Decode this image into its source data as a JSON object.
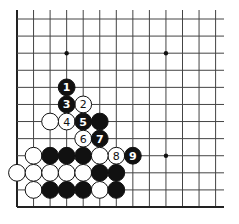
{
  "diagram": {
    "type": "go-board-corner",
    "corner": "bottom-left",
    "columns_visible": 13,
    "rows_visible": 12,
    "star_points": [
      {
        "col": 3,
        "row": 2
      },
      {
        "col": 9,
        "row": 2
      },
      {
        "col": 9,
        "row": 8
      }
    ],
    "colors": {
      "black_stone": "#111111",
      "white_stone": "#ffffff",
      "line": "#444444",
      "edge": "#222222"
    },
    "stones": [
      {
        "color": "black",
        "col": 3,
        "row": 4,
        "label": "1"
      },
      {
        "color": "white",
        "col": 4,
        "row": 5,
        "label": "2"
      },
      {
        "color": "black",
        "col": 3,
        "row": 5,
        "label": "3"
      },
      {
        "color": "white",
        "col": 3,
        "row": 6,
        "label": "4"
      },
      {
        "color": "black",
        "col": 4,
        "row": 6,
        "label": "5"
      },
      {
        "color": "white",
        "col": 4,
        "row": 7,
        "label": "6"
      },
      {
        "color": "black",
        "col": 5,
        "row": 7,
        "label": "7"
      },
      {
        "color": "white",
        "col": 6,
        "row": 8,
        "label": "8"
      },
      {
        "color": "black",
        "col": 7,
        "row": 8,
        "label": "9"
      },
      {
        "color": "white",
        "col": 2,
        "row": 6,
        "label": ""
      },
      {
        "color": "black",
        "col": 5,
        "row": 6,
        "label": ""
      },
      {
        "color": "white",
        "col": 1,
        "row": 8,
        "label": ""
      },
      {
        "color": "black",
        "col": 2,
        "row": 8,
        "label": ""
      },
      {
        "color": "black",
        "col": 3,
        "row": 8,
        "label": ""
      },
      {
        "color": "black",
        "col": 4,
        "row": 8,
        "label": ""
      },
      {
        "color": "white",
        "col": 5,
        "row": 8,
        "label": ""
      },
      {
        "color": "white",
        "col": 0,
        "row": 9,
        "label": ""
      },
      {
        "color": "white",
        "col": 1,
        "row": 9,
        "label": ""
      },
      {
        "color": "white",
        "col": 2,
        "row": 9,
        "label": ""
      },
      {
        "color": "white",
        "col": 3,
        "row": 9,
        "label": ""
      },
      {
        "color": "white",
        "col": 4,
        "row": 9,
        "label": ""
      },
      {
        "color": "black",
        "col": 5,
        "row": 9,
        "label": ""
      },
      {
        "color": "black",
        "col": 6,
        "row": 9,
        "label": ""
      },
      {
        "color": "white",
        "col": 1,
        "row": 10,
        "label": ""
      },
      {
        "color": "black",
        "col": 2,
        "row": 10,
        "label": ""
      },
      {
        "color": "black",
        "col": 3,
        "row": 10,
        "label": ""
      },
      {
        "color": "black",
        "col": 4,
        "row": 10,
        "label": ""
      },
      {
        "color": "white",
        "col": 5,
        "row": 10,
        "label": ""
      },
      {
        "color": "black",
        "col": 6,
        "row": 10,
        "label": ""
      }
    ]
  }
}
